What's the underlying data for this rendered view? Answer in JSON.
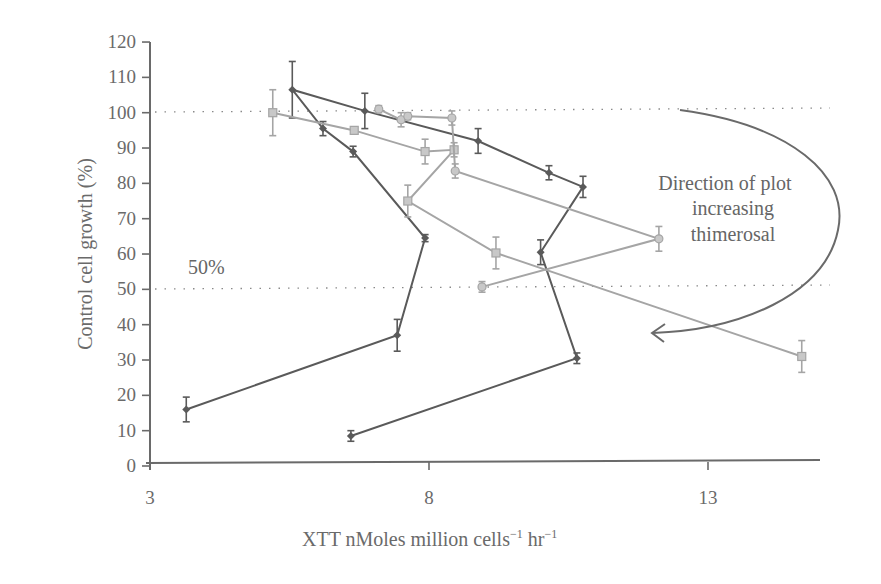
{
  "chart_data": {
    "type": "line",
    "title": "",
    "xlabel": "XTT nMoles million cells",
    "xlabel_superscript_1": "-1",
    "xlabel_mid": " hr",
    "xlabel_superscript_2": "-1",
    "ylabel": "Control cell growth (%)",
    "xlim": [
      3,
      16.2
    ],
    "ylim": [
      0,
      120
    ],
    "x_ticks": [
      3,
      8,
      13
    ],
    "x_tick_labels": [
      "3",
      "8",
      "13"
    ],
    "y_ticks": [
      0,
      10,
      20,
      30,
      40,
      50,
      60,
      70,
      80,
      90,
      100,
      110,
      120
    ],
    "y_tick_labels": [
      "0",
      "10",
      "20",
      "30",
      "40",
      "50",
      "60",
      "70",
      "80",
      "90",
      "100",
      "110",
      "120"
    ],
    "grid": false,
    "reference_lines": [
      {
        "y": 100,
        "style": "dotted",
        "label": ""
      },
      {
        "y": 50,
        "style": "dotted",
        "label": "50%"
      }
    ],
    "annotation": {
      "lines": [
        "Direction of plot",
        "increasing",
        "thimerosal"
      ],
      "arrow": "curved arrow from upper right around to lower left"
    },
    "series": [
      {
        "name": "Series A (dark)",
        "color": "#5a5a5a",
        "marker": "diamond",
        "points": [
          {
            "x": 3.65,
            "y": 16,
            "err": 3.5
          },
          {
            "x": 7.43,
            "y": 37,
            "err": 4.5
          },
          {
            "x": 7.93,
            "y": 64.5,
            "err": 1
          },
          {
            "x": 6.64,
            "y": 89,
            "err": 1.5
          },
          {
            "x": 6.1,
            "y": 95.5,
            "err": 2
          },
          {
            "x": 5.55,
            "y": 106.5,
            "err": 8
          },
          {
            "x": 6.85,
            "y": 100.5,
            "err": 5
          },
          {
            "x": 8.88,
            "y": 92,
            "err": 3.5
          },
          {
            "x": 10.15,
            "y": 83,
            "err": 2
          },
          {
            "x": 10.76,
            "y": 79,
            "err": 3
          },
          {
            "x": 10.0,
            "y": 60.5,
            "err": 3.5
          },
          {
            "x": 10.65,
            "y": 30.5,
            "err": 1.5
          },
          {
            "x": 6.6,
            "y": 8.5,
            "err": 1.5
          }
        ]
      },
      {
        "name": "Series B (light)",
        "color": "#a5a5a5",
        "marker": "square",
        "points": [
          {
            "x": 5.2,
            "y": 100,
            "err": 6.5
          },
          {
            "x": 6.66,
            "y": 95,
            "err": 1
          },
          {
            "x": 7.93,
            "y": 89,
            "err": 3.5
          },
          {
            "x": 8.45,
            "y": 89.5,
            "err": 2
          },
          {
            "x": 7.62,
            "y": 75,
            "err": 4.5
          },
          {
            "x": 9.2,
            "y": 60.3,
            "err": 4.5
          },
          {
            "x": 14.68,
            "y": 31,
            "err": 4.5
          }
        ]
      },
      {
        "name": "Series C (light)",
        "color": "#a5a5a5",
        "marker": "circle",
        "points": [
          {
            "x": 7.1,
            "y": 101,
            "err": 1
          },
          {
            "x": 7.5,
            "y": 98,
            "err": 2
          },
          {
            "x": 7.62,
            "y": 99,
            "err": 1
          },
          {
            "x": 8.41,
            "y": 98.5,
            "err": 2
          },
          {
            "x": 8.47,
            "y": 83.5,
            "err": 2
          },
          {
            "x": 12.12,
            "y": 64.3,
            "err": 3.5
          },
          {
            "x": 8.95,
            "y": 50.7,
            "err": 1.5
          }
        ]
      }
    ]
  },
  "labels": {
    "y_axis_title": "Control cell growth (%)",
    "x_axis_title_main": "XTT nMoles million cells",
    "x_axis_sup1": "−1",
    "x_axis_hr": " hr",
    "x_axis_sup2": "−1",
    "fifty_pct": "50%",
    "annotation_line1": "Direction of plot",
    "annotation_line2": "increasing",
    "annotation_line3": "thimerosal"
  }
}
